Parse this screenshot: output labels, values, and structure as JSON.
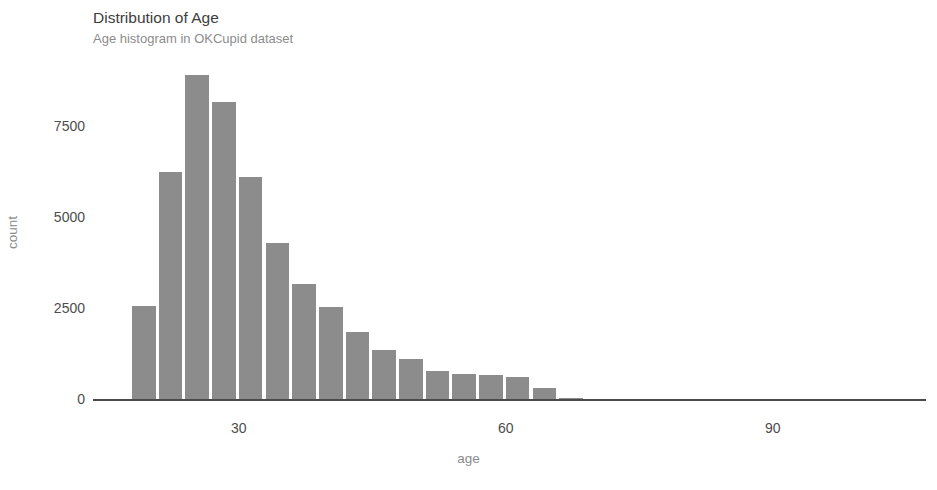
{
  "chart_data": {
    "type": "bar",
    "title": "Distribution of Age",
    "subtitle": "Age histogram in OKCupid dataset",
    "xlabel": "age",
    "ylabel": "count",
    "grid": false,
    "legend": false,
    "bar_color": "#8c8c8c",
    "axis_color": "#4a4a4a",
    "xlim": [
      16,
      110
    ],
    "ylim": [
      0,
      9000
    ],
    "xticks": [
      30,
      60,
      90
    ],
    "xtick_labels": [
      "30",
      "60",
      "90"
    ],
    "yticks": [
      0,
      2500,
      5000,
      7500
    ],
    "ytick_labels": [
      "0",
      "2500",
      "5000",
      "7500"
    ],
    "bin_width": 3,
    "categories": [
      "18-21",
      "21-24",
      "24-27",
      "27-30",
      "30-33",
      "33-36",
      "36-39",
      "39-42",
      "42-45",
      "45-48",
      "48-51",
      "51-54",
      "54-57",
      "57-60",
      "60-63",
      "63-66",
      "66-69"
    ],
    "x": [
      19.5,
      22.5,
      25.5,
      28.5,
      31.5,
      34.5,
      37.5,
      40.5,
      43.5,
      46.5,
      49.5,
      52.5,
      55.5,
      58.5,
      61.5,
      64.5,
      67.5
    ],
    "values": [
      2560,
      6250,
      8900,
      8150,
      6100,
      4300,
      3150,
      2540,
      1830,
      1360,
      1100,
      780,
      700,
      650,
      600,
      300,
      40
    ]
  }
}
